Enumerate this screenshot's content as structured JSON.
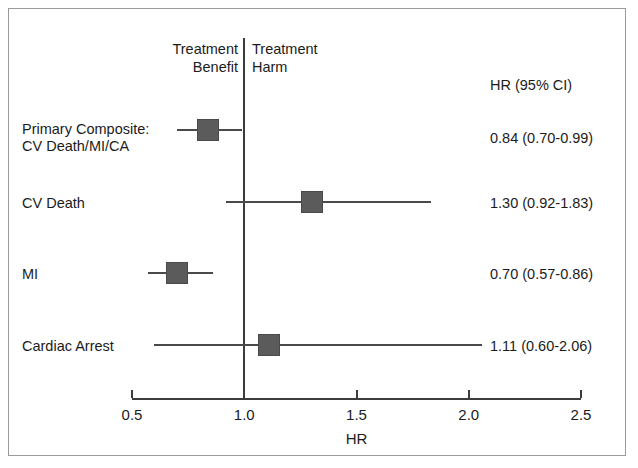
{
  "chart_data": {
    "type": "table",
    "subtype": "forest-plot",
    "title": "",
    "xlabel": "HR",
    "ylabel": "",
    "xlim": [
      0.5,
      2.5
    ],
    "xticks": [
      "0.5",
      "1.0",
      "1.5",
      "2.0",
      "2.5"
    ],
    "xtick_values": [
      0.5,
      1.0,
      1.5,
      2.0,
      2.5
    ],
    "grid": false,
    "reference_line": 1.0,
    "value_column_header": "HR (95% CI)",
    "left_region_label": "Treatment\nBenefit",
    "right_region_label": "Treatment\nHarm",
    "categories": [
      "Primary Composite:\nCV Death/MI/CA",
      "CV Death",
      "MI",
      "Cardiac Arrest"
    ],
    "values": [
      0.84,
      1.3,
      0.7,
      1.11
    ],
    "ci_low": [
      0.7,
      0.92,
      0.57,
      0.6
    ],
    "ci_high": [
      0.99,
      1.83,
      0.86,
      2.06
    ],
    "value_labels": [
      "0.84 (0.70-0.99)",
      "1.30 (0.92-1.83)",
      "0.70 (0.57-0.86)",
      "1.11 (0.60-2.06)"
    ]
  },
  "header": {
    "benefit_line1": "Treatment",
    "benefit_line2": "Benefit",
    "harm_line1": "Treatment",
    "harm_line2": "Harm",
    "hr_ci": "HR (95% CI)"
  },
  "rows": [
    {
      "label_line1": "Primary Composite:",
      "label_line2": "CV Death/MI/CA",
      "value": "0.84 (0.70-0.99)",
      "hr": 0.84,
      "lo": 0.7,
      "hi": 0.99
    },
    {
      "label_line1": "CV Death",
      "label_line2": "",
      "value": "1.30 (0.92-1.83)",
      "hr": 1.3,
      "lo": 0.92,
      "hi": 1.83
    },
    {
      "label_line1": "MI",
      "label_line2": "",
      "value": "0.70 (0.57-0.86)",
      "hr": 0.7,
      "lo": 0.57,
      "hi": 0.86
    },
    {
      "label_line1": "Cardiac Arrest",
      "label_line2": "",
      "value": "1.11 (0.60-2.06)",
      "hr": 1.11,
      "lo": 0.6,
      "hi": 2.06
    }
  ],
  "axis": {
    "title": "HR",
    "ticks": [
      "0.5",
      "1.0",
      "1.5",
      "2.0",
      "2.5"
    ]
  },
  "colors": {
    "marker": "#5b5b5b",
    "line": "#4a4a4a",
    "axis": "#3c3c3c",
    "text": "#1b1b1b",
    "frame": "#9a9a9a",
    "background": "#ffffff"
  }
}
